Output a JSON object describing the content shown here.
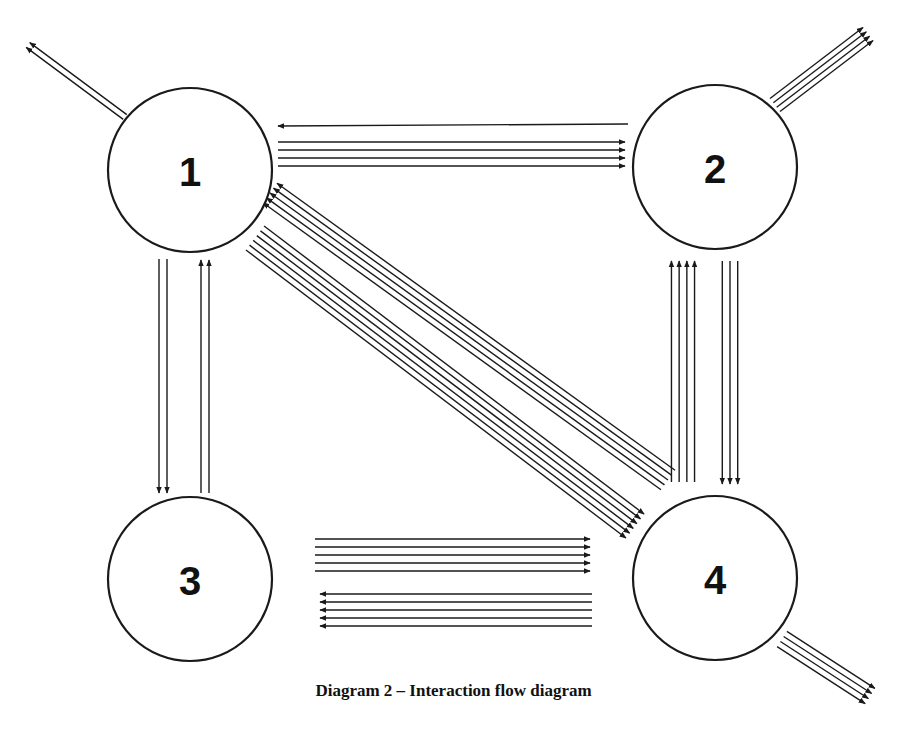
{
  "caption": "Diagram 2 – Interaction flow diagram",
  "colors": {
    "stroke": "#1a1a1a",
    "background": "#ffffff",
    "text": "#111111"
  },
  "nodes": [
    {
      "id": "1",
      "label": "1",
      "cx": 190,
      "cy": 170,
      "r": 82
    },
    {
      "id": "2",
      "label": "2",
      "cx": 715,
      "cy": 167,
      "r": 82
    },
    {
      "id": "3",
      "label": "3",
      "cx": 190,
      "cy": 579,
      "r": 82
    },
    {
      "id": "4",
      "label": "4",
      "cx": 715,
      "cy": 578,
      "r": 82
    }
  ],
  "flows": [
    {
      "name": "1-to-outside",
      "from": "1",
      "to": "outside",
      "count": 2,
      "x1": 125,
      "y1": 117,
      "x2": 28,
      "y2": 45,
      "spacing": 6
    },
    {
      "name": "2-to-1",
      "from": "2",
      "to": "1",
      "count": 1,
      "x1": 628,
      "y1": 124,
      "x2": 278,
      "y2": 126,
      "spacing": 8
    },
    {
      "name": "1-to-2",
      "from": "1",
      "to": "2",
      "count": 4,
      "x1": 278,
      "y1": 154,
      "x2": 625,
      "y2": 154,
      "spacing": 8
    },
    {
      "name": "2-to-outside",
      "from": "2",
      "to": "outside",
      "count": 4,
      "x1": 775,
      "y1": 105,
      "x2": 868,
      "y2": 34,
      "spacing": 5.5
    },
    {
      "name": "1-to-3",
      "from": "1",
      "to": "3",
      "count": 2,
      "x1": 163,
      "y1": 259,
      "x2": 163,
      "y2": 493,
      "spacing": 8
    },
    {
      "name": "3-to-1",
      "from": "3",
      "to": "1",
      "count": 2,
      "x1": 205,
      "y1": 493,
      "x2": 205,
      "y2": 260,
      "spacing": 8
    },
    {
      "name": "4-to-1",
      "from": "4",
      "to": "1",
      "count": 5,
      "x1": 668,
      "y1": 480,
      "x2": 270,
      "y2": 193,
      "spacing": 6
    },
    {
      "name": "1-to-4",
      "from": "1",
      "to": "4",
      "count": 6,
      "x1": 255,
      "y1": 238,
      "x2": 635,
      "y2": 526,
      "spacing": 6
    },
    {
      "name": "4-to-2",
      "from": "4",
      "to": "2",
      "count": 4,
      "x1": 683,
      "y1": 482,
      "x2": 683,
      "y2": 261,
      "spacing": 7.7
    },
    {
      "name": "2-to-4",
      "from": "2",
      "to": "4",
      "count": 3,
      "x1": 730,
      "y1": 261,
      "x2": 730,
      "y2": 484,
      "spacing": 7.7
    },
    {
      "name": "3-to-4",
      "from": "3",
      "to": "4",
      "count": 5,
      "x1": 315,
      "y1": 555,
      "x2": 590,
      "y2": 555,
      "spacing": 8
    },
    {
      "name": "4-to-3",
      "from": "4",
      "to": "3",
      "count": 5,
      "x1": 592,
      "y1": 610,
      "x2": 320,
      "y2": 610,
      "spacing": 8
    },
    {
      "name": "4-to-outside",
      "from": "4",
      "to": "outside",
      "count": 4,
      "x1": 782,
      "y1": 639,
      "x2": 870,
      "y2": 696,
      "spacing": 6
    }
  ]
}
